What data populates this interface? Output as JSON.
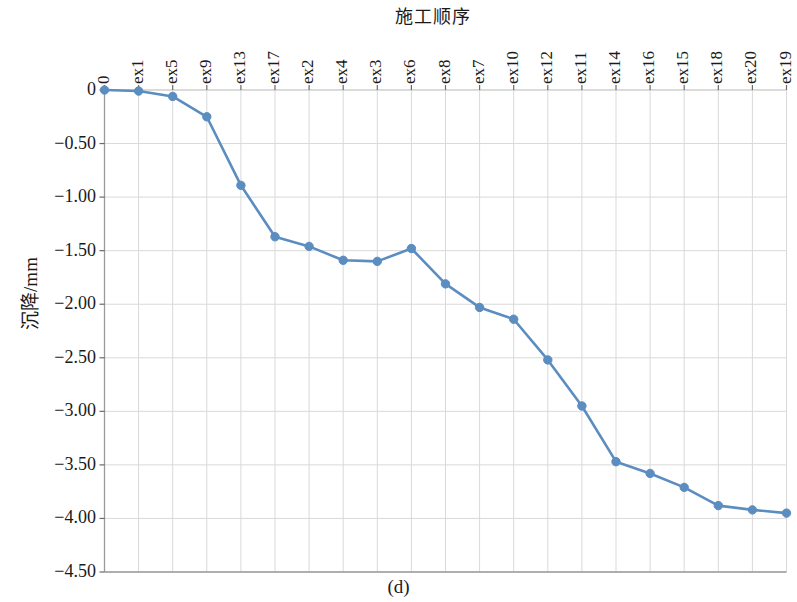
{
  "figure": {
    "caption": "(d)",
    "background": "#ffffff"
  },
  "axes": {
    "x_title": "施工顺序",
    "y_title": "沉降/mm",
    "y_ticks": [
      "0",
      "−0.50",
      "−1.00",
      "−1.50",
      "−2.00",
      "−2.50",
      "−3.00",
      "−3.50",
      "−4.00",
      "−4.50"
    ],
    "x_ticks": [
      "0",
      "ex1",
      "ex5",
      "ex9",
      "ex13",
      "ex17",
      "ex2",
      "ex4",
      "ex3",
      "ex6",
      "ex8",
      "ex7",
      "ex10",
      "ex12",
      "ex11",
      "ex14",
      "ex16",
      "ex15",
      "ex18",
      "ex20",
      "ex19"
    ]
  },
  "style": {
    "line_color": "#5B8DC0",
    "marker_color": "#5B8DC0",
    "grid_color": "#d9d9d9",
    "axis_color": "#b0b0b0",
    "line_width": 2.6,
    "marker_radius": 4.2
  },
  "chart_data": {
    "type": "line",
    "title": "施工顺序",
    "xlabel": "施工顺序",
    "ylabel": "沉降/mm",
    "categories": [
      "0",
      "ex1",
      "ex5",
      "ex9",
      "ex13",
      "ex17",
      "ex2",
      "ex4",
      "ex3",
      "ex6",
      "ex8",
      "ex7",
      "ex10",
      "ex12",
      "ex11",
      "ex14",
      "ex16",
      "ex15",
      "ex18",
      "ex20",
      "ex19"
    ],
    "values": [
      0.0,
      -0.01,
      -0.06,
      -0.25,
      -0.89,
      -1.37,
      -1.46,
      -1.59,
      -1.6,
      -1.48,
      -1.81,
      -2.03,
      -2.14,
      -2.52,
      -2.95,
      -3.47,
      -3.58,
      -3.71,
      -3.88,
      -3.92,
      -3.95
    ],
    "series": [
      {
        "name": "沉降",
        "values": [
          0.0,
          -0.01,
          -0.06,
          -0.25,
          -0.89,
          -1.37,
          -1.46,
          -1.59,
          -1.6,
          -1.48,
          -1.81,
          -2.03,
          -2.14,
          -2.52,
          -2.95,
          -3.47,
          -3.58,
          -3.71,
          -3.88,
          -3.92,
          -3.95
        ]
      }
    ],
    "ylim": [
      -4.5,
      0
    ],
    "xlim": [
      0,
      20
    ],
    "y_tick_values": [
      0,
      -0.5,
      -1.0,
      -1.5,
      -2.0,
      -2.5,
      -3.0,
      -3.5,
      -4.0,
      -4.5
    ],
    "grid": true,
    "legend": "none",
    "marker": "circle",
    "x_axis_position": "top"
  }
}
